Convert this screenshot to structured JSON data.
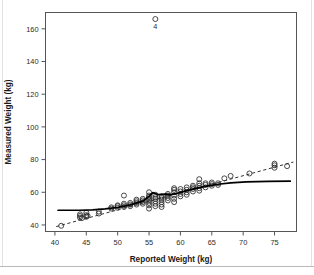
{
  "figure": {
    "background_color": "#ffffff",
    "frame_color": "#555555"
  },
  "chart_data": {
    "type": "scatter",
    "title": "",
    "subtitle": "",
    "xlabel": "Reported Weight (kg)",
    "ylabel": "Measured Weight (kg)",
    "xlim": [
      38.5,
      78.5
    ],
    "ylim": [
      36,
      170
    ],
    "xticks": [
      40,
      45,
      50,
      55,
      60,
      65,
      70,
      75
    ],
    "yticks": [
      40,
      60,
      80,
      100,
      120,
      140,
      160
    ],
    "grid": false,
    "legend": null,
    "legend_position": "none",
    "marker": "open-circle",
    "marker_color": "#2a2a2a",
    "annotations": [
      {
        "text": "4",
        "x": 56,
        "y": 160,
        "describes": "outlier point at x=56, y=166"
      }
    ],
    "series": [
      {
        "name": "observations",
        "type": "scatter",
        "points": [
          [
            41,
            39.5
          ],
          [
            44,
            44.5
          ],
          [
            44,
            45.5
          ],
          [
            44,
            46.5
          ],
          [
            44.3,
            44.2
          ],
          [
            45,
            45.0
          ],
          [
            45,
            46.0
          ],
          [
            45,
            47.5
          ],
          [
            45.2,
            45.6
          ],
          [
            47,
            47.0
          ],
          [
            47,
            48.2
          ],
          [
            49,
            50.0
          ],
          [
            49,
            50.8
          ],
          [
            50,
            50.5
          ],
          [
            50,
            51.5
          ],
          [
            50,
            52.0
          ],
          [
            51,
            51.0
          ],
          [
            51,
            52.0
          ],
          [
            51,
            53.0
          ],
          [
            51,
            58.0
          ],
          [
            52,
            51.5
          ],
          [
            52,
            52.5
          ],
          [
            52,
            53.5
          ],
          [
            53,
            52.5
          ],
          [
            53,
            53.5
          ],
          [
            53,
            54.5
          ],
          [
            53,
            55.5
          ],
          [
            54,
            53.0
          ],
          [
            54,
            54.0
          ],
          [
            54,
            55.0
          ],
          [
            54,
            56.0
          ],
          [
            55,
            50.0
          ],
          [
            55,
            52.0
          ],
          [
            55,
            53.5
          ],
          [
            55,
            55.0
          ],
          [
            55,
            56.0
          ],
          [
            55,
            57.0
          ],
          [
            55,
            58.0
          ],
          [
            55,
            60.0
          ],
          [
            56,
            51.5
          ],
          [
            56,
            53.0
          ],
          [
            56,
            54.5
          ],
          [
            56,
            56.0
          ],
          [
            56,
            57.0
          ],
          [
            56,
            58.5
          ],
          [
            56,
            166.0
          ],
          [
            57,
            51.0
          ],
          [
            57,
            52.5
          ],
          [
            57,
            54.0
          ],
          [
            57,
            55.5
          ],
          [
            57,
            56.5
          ],
          [
            57,
            57.5
          ],
          [
            58,
            55.0
          ],
          [
            58,
            56.5
          ],
          [
            58,
            58.0
          ],
          [
            58,
            59.0
          ],
          [
            59,
            54.0
          ],
          [
            59,
            56.0
          ],
          [
            59,
            58.0
          ],
          [
            59,
            60.0
          ],
          [
            59,
            61.5
          ],
          [
            59,
            62.5
          ],
          [
            60,
            57.5
          ],
          [
            60,
            59.0
          ],
          [
            60,
            60.5
          ],
          [
            60,
            62.0
          ],
          [
            61,
            58.5
          ],
          [
            61,
            60.0
          ],
          [
            61,
            61.5
          ],
          [
            61,
            63.0
          ],
          [
            62,
            60.5
          ],
          [
            62,
            62.0
          ],
          [
            62,
            63.0
          ],
          [
            62,
            64.0
          ],
          [
            63,
            61.0
          ],
          [
            63,
            62.5
          ],
          [
            63,
            64.0
          ],
          [
            63,
            65.5
          ],
          [
            63,
            68.0
          ],
          [
            64,
            63.0
          ],
          [
            64,
            64.5
          ],
          [
            64,
            65.5
          ],
          [
            65,
            64.0
          ],
          [
            65,
            65.0
          ],
          [
            65,
            66.0
          ],
          [
            66,
            64.5
          ],
          [
            66,
            65.5
          ],
          [
            67,
            68.5
          ],
          [
            68,
            70.0
          ],
          [
            71,
            71.5
          ],
          [
            75,
            75.0
          ],
          [
            75,
            76.5
          ],
          [
            75,
            77.5
          ],
          [
            77,
            76.0
          ]
        ]
      },
      {
        "name": "identity-line",
        "type": "line",
        "style": "dashed",
        "points": [
          [
            40.2,
            39.0
          ],
          [
            78.0,
            78.5
          ]
        ]
      },
      {
        "name": "loess-smooth",
        "type": "line",
        "style": "solid",
        "points": [
          [
            40.5,
            49.0
          ],
          [
            44,
            49.0
          ],
          [
            46,
            49.2
          ],
          [
            48,
            49.8
          ],
          [
            50,
            50.8
          ],
          [
            52,
            52.3
          ],
          [
            54,
            54.6
          ],
          [
            55,
            57.5
          ],
          [
            55.6,
            59.8
          ],
          [
            56.4,
            58.6
          ],
          [
            57.5,
            58.9
          ],
          [
            58.5,
            58.6
          ],
          [
            59.5,
            59.4
          ],
          [
            61,
            61.0
          ],
          [
            62.5,
            62.4
          ],
          [
            64,
            63.6
          ],
          [
            66,
            64.9
          ],
          [
            68,
            65.8
          ],
          [
            70.5,
            66.4
          ],
          [
            74,
            66.7
          ],
          [
            77.5,
            66.8
          ]
        ]
      }
    ]
  }
}
